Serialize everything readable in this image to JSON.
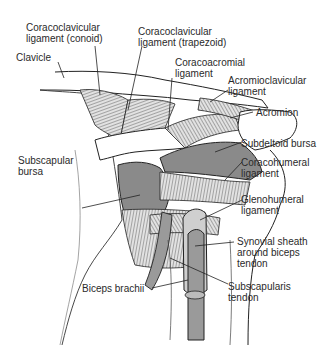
{
  "labels": {
    "coracoclavicular_conoid": "Coracoclavicular\nligament (conoid)",
    "coracoclavicular_trapezoid": "Coracoclavicular\nligament (trapezoid)",
    "clavicle": "Clavicle",
    "coracoacromial": "Coracoacromial\nligament",
    "acromioclavicular": "Acromioclavicular\nligament",
    "acromion": "Acromion",
    "subdeltoid_bursa": "Subdeltoid bursa",
    "subscapular_bursa": "Subscapular\nbursa",
    "coracohumeral": "Coracohumeral\nligament",
    "glenohumeral": "Glenohumeral\nligament",
    "synovial_sheath": "Synovial sheath\naround biceps\ntendon",
    "biceps_brachii": "Biceps brachii",
    "subscapularis_tendon": "Subscapularis\ntendon"
  },
  "colors": {
    "bursa_fill": "#8a8a8a",
    "ligament_fill": "#d6d6d6",
    "outline": "#222222"
  }
}
